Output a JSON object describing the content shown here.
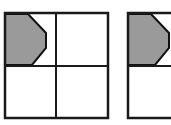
{
  "image": {
    "kind": "geometry-diagram",
    "width": 171,
    "height": 125,
    "background_color": "#ffffff",
    "description_label": "",
    "shape_count_label": ""
  },
  "palette": {
    "stroke": "#1a1a1a",
    "shaded_fill": "#9a9a9a",
    "shaded_stroke": "#111111",
    "cell_fill": "#ffffff",
    "page_background": "#ffffff"
  },
  "figures": [
    {
      "id": "figure-left",
      "label": "",
      "grid": {
        "rows": 2,
        "cols": 2,
        "x": 5,
        "y": 13,
        "width": 103,
        "height": 105,
        "divider_x": 56,
        "divider_y": 66,
        "outer_stroke_width": 2,
        "inner_stroke_width": 2
      },
      "shaded_cell": "top-left",
      "shaded_shape": {
        "name": "pentagon-arrow-right",
        "vertices": "5,14 28,14 46,33 46,48 32,65 5,65",
        "fill": "#9a9a9a",
        "stroke": "#111111",
        "stroke_width": 2
      },
      "clipped": false
    },
    {
      "id": "figure-right",
      "label": "",
      "grid": {
        "rows": 2,
        "cols": 2,
        "x": 128,
        "y": 13,
        "width": 103,
        "height": 105,
        "divider_x": 179,
        "divider_y": 66,
        "outer_stroke_width": 2,
        "inner_stroke_width": 2
      },
      "shaded_cell": "top-left",
      "shaded_shape": {
        "name": "pentagon-arrow-right",
        "vertices": "128,14 151,14 169,33 169,48 155,65 128,65",
        "fill": "#9a9a9a",
        "stroke": "#111111",
        "stroke_width": 2
      },
      "clipped": true
    }
  ]
}
